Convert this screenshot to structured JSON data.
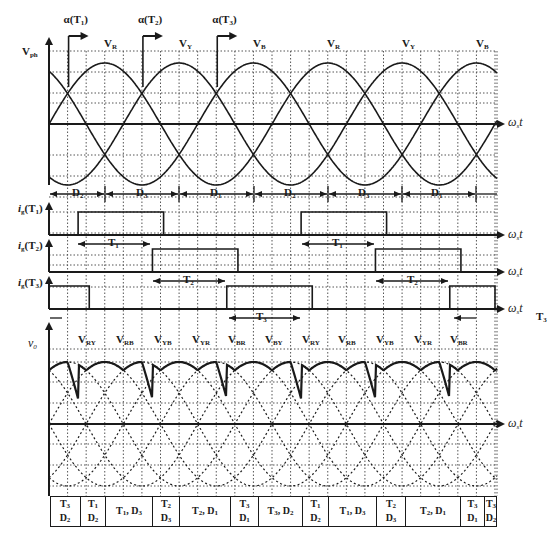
{
  "chart_data": {
    "type": "line",
    "x_axis_label": "ωst",
    "period_px": 223,
    "degrees_per_grid": 30,
    "panels": [
      {
        "id": "phase_voltages",
        "ylabel": "Vph",
        "series": [
          {
            "name": "VR",
            "phase_deg": 0
          },
          {
            "name": "VY",
            "phase_deg": -120
          },
          {
            "name": "VB",
            "phase_deg": -240
          }
        ],
        "top_labels": [
          "VR",
          "VY",
          "VB",
          "VR",
          "VY",
          "VB"
        ],
        "firing_markers": [
          "α(T1)",
          "α(T2)",
          "α(T3)"
        ],
        "diode_intervals": [
          "D2",
          "D3",
          "D1",
          "D2",
          "D3",
          "D1"
        ]
      },
      {
        "id": "gate_T1",
        "ylabel": "ig(T1)",
        "pulses_deg": [
          [
            47,
            185
          ],
          [
            407,
            545
          ]
        ],
        "interval_label": "T1"
      },
      {
        "id": "gate_T2",
        "ylabel": "ig(T2)",
        "pulses_deg": [
          [
            167,
            305
          ],
          [
            527,
            665
          ]
        ],
        "interval_label": "T2"
      },
      {
        "id": "gate_T3",
        "ylabel": "ig(T3)",
        "pulses_deg": [
          [
            -30,
            65
          ],
          [
            287,
            425
          ],
          [
            647,
            720
          ]
        ],
        "interval_label": "T3"
      },
      {
        "id": "output_voltage",
        "ylabel": "v0",
        "segment_labels": [
          "VRY",
          "VRB",
          "VYB",
          "VYR",
          "VBR",
          "VBY",
          "VRY",
          "VRB",
          "VYB",
          "VYR",
          "VBR"
        ]
      }
    ],
    "conduction_table": [
      {
        "top": "T3",
        "bottom": "D2"
      },
      {
        "top": "T1",
        "bottom": "D2"
      },
      {
        "top": "T1, D3",
        "bottom": ""
      },
      {
        "top": "T2",
        "bottom": "D3"
      },
      {
        "top": "T2, D1",
        "bottom": ""
      },
      {
        "top": "T3",
        "bottom": "D1"
      },
      {
        "top": "T3, D2",
        "bottom": ""
      },
      {
        "top": "T1",
        "bottom": "D2"
      },
      {
        "top": "T1, D3",
        "bottom": ""
      },
      {
        "top": "T2",
        "bottom": "D3"
      },
      {
        "top": "T2, D1",
        "bottom": ""
      },
      {
        "top": "T3",
        "bottom": "D1"
      },
      {
        "top": "T3",
        "bottom": "D2"
      }
    ]
  },
  "labels": {
    "vph": {
      "main": "V",
      "sub": "ph"
    },
    "omega": "ω",
    "omega_sub": "s",
    "t": "t",
    "v0": "v",
    "v0_sub": "0",
    "ig": "i",
    "ig_sub": "g"
  },
  "colors": {
    "line": "#1a1a1a",
    "grid": "#555555",
    "background": "#ffffff"
  }
}
